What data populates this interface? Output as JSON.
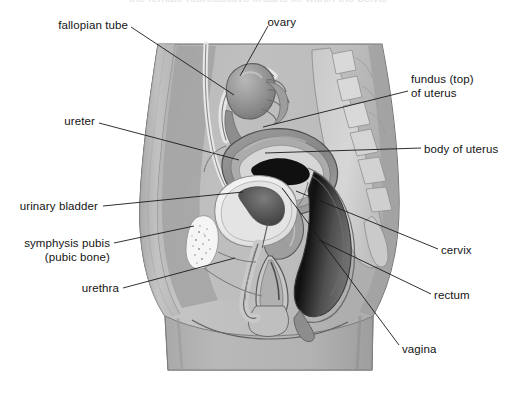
{
  "figure": {
    "width": 516,
    "height": 410,
    "background_color": "#ffffff",
    "leader_line_color": "#1a1a1a",
    "text_color": "#141414",
    "top_cut_text": "the female reproductive organs lie within the pelvis"
  },
  "palette": {
    "skin_outer": "#b9b9b9",
    "skin_shadow": "#a3a3a3",
    "body_fill": "#c2c2c2",
    "muscle_dark": "#8f8f8f",
    "muscle_mid": "#9d9d9d",
    "uterus_wall": "#8a8a8a",
    "uterus_mid": "#b0b0b0",
    "uterus_inner": "#d8d8d8",
    "cavity_black": "#111111",
    "bladder_light": "#ededed",
    "bladder_rim": "#d2d2d2",
    "bladder_interior": "#5d5d5d",
    "pubic_bone": "#f4f4f4",
    "rectum_dark": "#151515",
    "rectum_mid": "#6f6f6f",
    "vertebra_fill": "#cfcfcf",
    "ovary_fill": "#9a9a9a",
    "tube_light": "#e3e3e3",
    "outline": "#4a4a4a"
  },
  "labels": [
    {
      "id": "fallopian-tube",
      "text": "fallopian tube",
      "side": "left",
      "text_x": 128,
      "text_y": 18,
      "leader": [
        [
          131,
          27
        ],
        [
          234,
          95
        ]
      ]
    },
    {
      "id": "ovary",
      "text": "ovary",
      "side": "left",
      "text_x": 296,
      "text_y": 15,
      "leader": [
        [
          268,
          26
        ],
        [
          240,
          76
        ]
      ]
    },
    {
      "id": "fundus-of-uterus",
      "text": "fundus (top)\nof uterus",
      "line1": "fundus (top)",
      "line2": "of uterus",
      "side": "right",
      "text_x": 411,
      "text_y": 72,
      "leader": [
        [
          408,
          91
        ],
        [
          263,
          127
        ]
      ]
    },
    {
      "id": "ureter",
      "text": "ureter",
      "side": "left",
      "text_x": 95,
      "text_y": 114,
      "leader": [
        [
          99,
          123
        ],
        [
          239,
          160
        ]
      ]
    },
    {
      "id": "body-of-uterus",
      "text": "body of uterus",
      "side": "right",
      "text_x": 424,
      "text_y": 142,
      "leader": [
        [
          421,
          148
        ],
        [
          265,
          153
        ]
      ]
    },
    {
      "id": "urinary-bladder",
      "text": "urinary bladder",
      "side": "left",
      "text_x": 98,
      "text_y": 199,
      "leader": [
        [
          103,
          206
        ],
        [
          243,
          192
        ]
      ]
    },
    {
      "id": "symphysis-pubis",
      "text": "symphysis pubis\n(pubic bone)",
      "line1": "symphysis pubis",
      "line2": "(pubic bone)",
      "side": "left",
      "text_x": 110,
      "text_y": 236,
      "leader": [
        [
          114,
          243
        ],
        [
          194,
          226
        ]
      ]
    },
    {
      "id": "urethra",
      "text": "urethra",
      "side": "left",
      "text_x": 119,
      "text_y": 281,
      "leader": [
        [
          123,
          288
        ],
        [
          235,
          258
        ]
      ]
    },
    {
      "id": "cervix",
      "text": "cervix",
      "side": "right",
      "text_x": 441,
      "text_y": 243,
      "leader": [
        [
          438,
          249
        ],
        [
          296,
          191
        ]
      ]
    },
    {
      "id": "rectum",
      "text": "rectum",
      "side": "right",
      "text_x": 434,
      "text_y": 288,
      "leader": [
        [
          431,
          294
        ],
        [
          319,
          240
        ]
      ]
    },
    {
      "id": "vagina",
      "text": "vagina",
      "side": "right",
      "text_x": 402,
      "text_y": 342,
      "leader": [
        [
          399,
          345
        ],
        [
          282,
          188
        ]
      ]
    }
  ]
}
